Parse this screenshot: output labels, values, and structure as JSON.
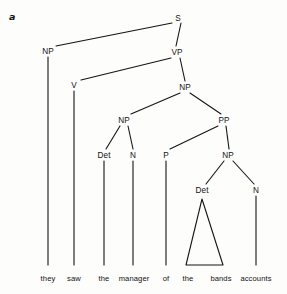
{
  "figure": {
    "label": "a",
    "kind": "syntax-tree-diagram",
    "width": 287,
    "height": 294,
    "background_color": "#fdfdfc",
    "line_color": "#141414"
  },
  "sentence": {
    "text": "they saw the manager of the bands accounts",
    "words": [
      {
        "text": "they",
        "x": 48,
        "y": 274
      },
      {
        "text": "saw",
        "x": 74,
        "y": 274
      },
      {
        "text": "the",
        "x": 104,
        "y": 274
      },
      {
        "text": "manager",
        "x": 134,
        "y": 274
      },
      {
        "text": "of",
        "x": 166,
        "y": 274
      },
      {
        "text": "the",
        "x": 188,
        "y": 274
      },
      {
        "text": "bands",
        "x": 221,
        "y": 274
      },
      {
        "text": "accounts",
        "x": 256,
        "y": 274
      }
    ]
  },
  "nodes": [
    {
      "id": "S",
      "label": "S",
      "x": 178,
      "y": 18
    },
    {
      "id": "NP1",
      "label": "NP",
      "x": 48,
      "y": 51
    },
    {
      "id": "VP",
      "label": "VP",
      "x": 177,
      "y": 52
    },
    {
      "id": "V",
      "label": "V",
      "x": 74,
      "y": 85
    },
    {
      "id": "NP2",
      "label": "NP",
      "x": 185,
      "y": 87
    },
    {
      "id": "NP3",
      "label": "NP",
      "x": 124,
      "y": 120
    },
    {
      "id": "PP",
      "label": "PP",
      "x": 224,
      "y": 120
    },
    {
      "id": "Det1",
      "label": "Det",
      "x": 104,
      "y": 155
    },
    {
      "id": "N1",
      "label": "N",
      "x": 133,
      "y": 155
    },
    {
      "id": "P",
      "label": "P",
      "x": 166,
      "y": 155
    },
    {
      "id": "NP4",
      "label": "NP",
      "x": 228,
      "y": 155
    },
    {
      "id": "Det2",
      "label": "Det",
      "x": 202,
      "y": 190
    },
    {
      "id": "N2",
      "label": "N",
      "x": 256,
      "y": 190
    }
  ],
  "edges": [
    {
      "from": "S",
      "to": "NP1",
      "x1": 172,
      "y1": 23,
      "x2": 56,
      "y2": 46
    },
    {
      "from": "S",
      "to": "VP",
      "x1": 181,
      "y1": 23,
      "x2": 176,
      "y2": 46
    },
    {
      "from": "VP",
      "to": "V",
      "x1": 171,
      "y1": 58,
      "x2": 81,
      "y2": 80
    },
    {
      "from": "VP",
      "to": "NP2",
      "x1": 180,
      "y1": 58,
      "x2": 185,
      "y2": 81
    },
    {
      "from": "NP2",
      "to": "NP3",
      "x1": 180,
      "y1": 93,
      "x2": 131,
      "y2": 114
    },
    {
      "from": "NP2",
      "to": "PP",
      "x1": 190,
      "y1": 93,
      "x2": 221,
      "y2": 114
    },
    {
      "from": "NP3",
      "to": "Det1",
      "x1": 120,
      "y1": 126,
      "x2": 106,
      "y2": 149
    },
    {
      "from": "NP3",
      "to": "N1",
      "x1": 128,
      "y1": 126,
      "x2": 133,
      "y2": 149
    },
    {
      "from": "PP",
      "to": "P",
      "x1": 218,
      "y1": 126,
      "x2": 170,
      "y2": 149
    },
    {
      "from": "PP",
      "to": "NP4",
      "x1": 226,
      "y1": 126,
      "x2": 229,
      "y2": 149
    },
    {
      "from": "NP4",
      "to": "Det2",
      "x1": 224,
      "y1": 161,
      "x2": 206,
      "y2": 184
    },
    {
      "from": "NP4",
      "to": "N2",
      "x1": 233,
      "y1": 161,
      "x2": 254,
      "y2": 184
    }
  ],
  "stems": [
    {
      "node": "NP1",
      "x": 48,
      "y1": 57,
      "y2": 265
    },
    {
      "node": "V",
      "x": 74,
      "y1": 91,
      "y2": 265
    },
    {
      "node": "Det1",
      "x": 104,
      "y1": 161,
      "y2": 265
    },
    {
      "node": "N1",
      "x": 133,
      "y1": 161,
      "y2": 265
    },
    {
      "node": "P",
      "x": 166,
      "y1": 161,
      "y2": 265
    },
    {
      "node": "N2",
      "x": 256,
      "y1": 196,
      "y2": 265
    }
  ],
  "triangle": {
    "node": "Det2",
    "covers": "the bands",
    "apex_x": 202,
    "apex_y": 199,
    "left_x": 186,
    "right_x": 223,
    "base_y": 265
  }
}
